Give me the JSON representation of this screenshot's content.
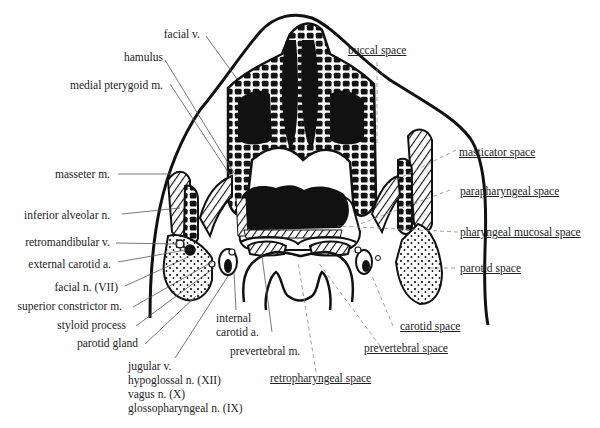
{
  "diagram": {
    "left_labels": {
      "facial_v": "facial v.",
      "hamulus": "hamulus",
      "medial_pterygoid": "medial pterygoid m.",
      "masseter": "masseter m.",
      "inferior_alveolar": "inferior alveolar n.",
      "retromandibular": "retromandibular v.",
      "external_carotid": "external carotid a.",
      "facial_n": "facial n. (VII)",
      "superior_constrictor": "superior constrictor m.",
      "styloid": "styloid process",
      "parotid_gland": "parotid gland"
    },
    "bottom_labels": {
      "internal_carotid_1": "internal",
      "internal_carotid_2": "carotid a.",
      "prevertebral_m": "prevertebral m.",
      "jugular": "jugular v.",
      "hypoglossal": "hypoglossal n. (XII)",
      "vagus": "vagus n. (X)",
      "glossopharyngeal": "glossopharyngeal n. (IX)"
    },
    "space_labels": {
      "buccal": "buccal space",
      "masticator": "masticator space",
      "parapharyngeal": "parapharyngeal space",
      "pharyngeal_mucosal": "pharyngeal mucosal space",
      "parotid": "parotid space",
      "carotid": "carotid space",
      "prevertebral": "prevertebral space",
      "retropharyngeal": "retropharyngeal space"
    },
    "colors": {
      "ink": "#111111",
      "label": "#222222",
      "leader": "#555555",
      "dashed_leader": "#888888"
    }
  }
}
